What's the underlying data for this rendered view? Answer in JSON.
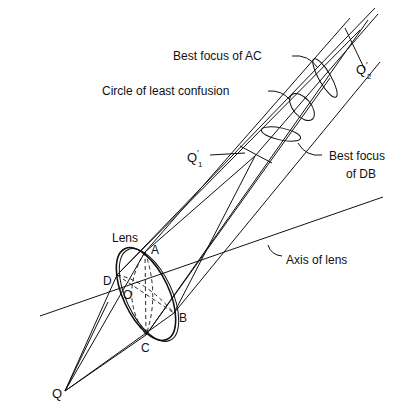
{
  "diagram": {
    "type": "optics-astigmatism",
    "labels": {
      "best_focus_ac": "Best focus of AC",
      "circle_least_confusion": "Circle of least confusion",
      "best_focus_db_line1": "Best focus",
      "best_focus_db_line2": "of DB",
      "q1_prime": "Q",
      "q1_sub": "1",
      "q2_prime": "Q",
      "q2_sub": "2",
      "lens": "Lens",
      "axis": "Axis of lens",
      "point_a": "A",
      "point_b": "B",
      "point_c": "C",
      "point_d": "D",
      "point_o": "O",
      "point_q": "Q"
    },
    "colors": {
      "ink": "#111111",
      "background": "#ffffff"
    }
  }
}
